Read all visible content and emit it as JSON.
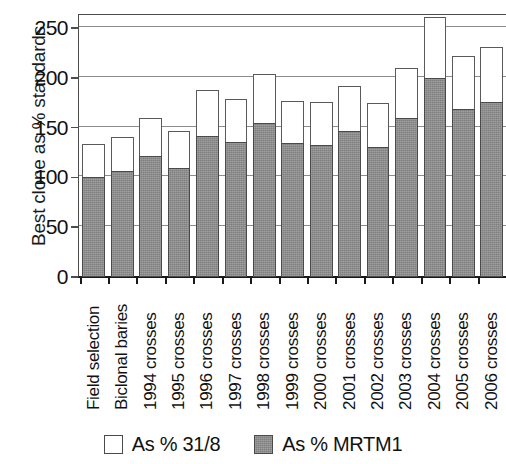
{
  "chart_data": {
    "type": "bar",
    "title": "",
    "xlabel": "",
    "ylabel": "Best clone as % standards",
    "ylim": [
      0,
      264
    ],
    "yticks": [
      0,
      50,
      100,
      150,
      200,
      250
    ],
    "ytick_labels": [
      "0",
      "50",
      "100",
      "150",
      "200",
      "250"
    ],
    "grid": true,
    "stacked": true,
    "legend_position": "bottom",
    "categories": [
      "Field selection",
      "Biclonal baries",
      "1994 crosses",
      "1995 crosses",
      "1996 crosses",
      "1997 crosses",
      "1998 crosses",
      "1999 crosses",
      "2000 crosses",
      "2001 crosses",
      "2002 crosses",
      "2003 crosses",
      "2004 crosses",
      "2005 crosses",
      "2006 crosses"
    ],
    "series": [
      {
        "name": "As % MRTM1",
        "color": "#8d8d8d",
        "values": [
          100,
          106,
          121,
          109,
          141,
          135,
          154,
          134,
          132,
          146,
          130,
          159,
          199,
          168,
          175
        ]
      },
      {
        "name": "As % 31/8",
        "color": "#ffffff",
        "values": [
          133,
          140,
          159,
          146,
          187,
          178,
          203,
          176,
          175,
          191,
          174,
          209,
          261,
          221,
          230
        ]
      }
    ]
  },
  "legend": {
    "items": [
      {
        "label": "As % 31/8",
        "swatch": "white-square-swatch"
      },
      {
        "label": "As % MRTM1",
        "swatch": "grey-square-swatch"
      }
    ]
  }
}
